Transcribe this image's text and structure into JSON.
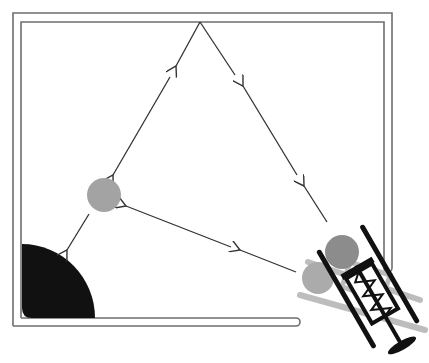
{
  "diagram": {
    "type": "pinball-trajectory",
    "colors": {
      "background": "#ffffff",
      "wall": "#6e6e6e",
      "arrow": "#333333",
      "bumper": "#111111",
      "ball_target": "#a3a3a3",
      "ball_launched": "#8c8c8c",
      "ball_ghost": "#ababab",
      "plunger": "#111111",
      "plunger_shadow": "#bdbdbd"
    },
    "balls": [
      {
        "name": "target-ball",
        "cx": 104,
        "cy": 195,
        "r": 17
      },
      {
        "name": "launched-ball",
        "cx": 342,
        "cy": 252,
        "r": 17
      },
      {
        "name": "ghost-ball",
        "cx": 318,
        "cy": 278,
        "r": 16
      }
    ],
    "paths": [
      {
        "name": "path-launch-to-top",
        "segments": 3
      },
      {
        "name": "path-top-to-ball",
        "segments": 2
      },
      {
        "name": "path-ball-to-bumper",
        "segments": 1
      },
      {
        "name": "path-launch-to-ball",
        "segments": 2
      }
    ]
  }
}
